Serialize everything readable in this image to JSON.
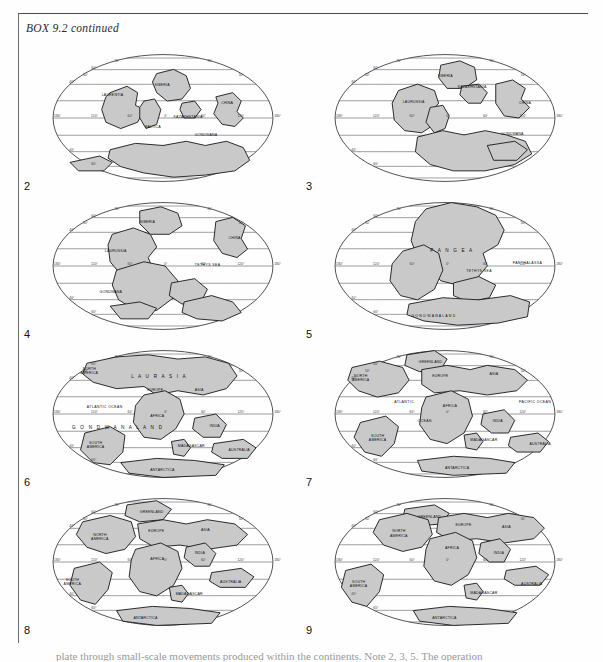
{
  "box": {
    "title": "BOX 9.2  continued"
  },
  "body_text": "plate through small-scale movements produced within the continents. Note 2, 3, 5. The operation",
  "graticule": {
    "lat_ticks": [
      "60°",
      "40°",
      "0°",
      "40°",
      "60°"
    ],
    "lon_ticks": [
      "120°",
      "60°",
      "0°",
      "60°",
      "120°",
      "180°"
    ],
    "pole_tick": "80°",
    "projection": "Mollweide"
  },
  "panels": [
    {
      "number": "2",
      "name": "panel-2",
      "labels": [
        {
          "text": "SIBERIA",
          "x": 102,
          "y": 40,
          "cls": "lbl"
        },
        {
          "text": "LAURENTIA",
          "x": 52,
          "y": 49,
          "cls": "lbl"
        },
        {
          "text": "KAZAKHSTANIA",
          "x": 120,
          "y": 70,
          "cls": "lbl"
        },
        {
          "text": "BALTICA",
          "x": 93,
          "y": 79,
          "cls": "lbl"
        },
        {
          "text": "CHINA",
          "x": 165,
          "y": 57,
          "cls": "lbl"
        },
        {
          "text": "GONDWANA",
          "x": 140,
          "y": 87,
          "cls": "lbl"
        }
      ]
    },
    {
      "number": "3",
      "name": "panel-3",
      "labels": [
        {
          "text": "SIBERIA",
          "x": 103,
          "y": 31,
          "cls": "lbl"
        },
        {
          "text": "KAZAKHSTANIA",
          "x": 122,
          "y": 42,
          "cls": "lbl"
        },
        {
          "text": "LAURUSSIA",
          "x": 70,
          "y": 56,
          "cls": "lbl"
        },
        {
          "text": "CHINA",
          "x": 180,
          "y": 57,
          "cls": "lbl"
        },
        {
          "text": "GONDWANA",
          "x": 163,
          "y": 86,
          "cls": "lbl"
        }
      ]
    },
    {
      "number": "4",
      "name": "panel-4",
      "labels": [
        {
          "text": "SIBERIA",
          "x": 88,
          "y": 29,
          "cls": "lbl"
        },
        {
          "text": "LAURUSSIA",
          "x": 55,
          "y": 57,
          "cls": "lbl"
        },
        {
          "text": "CHINA",
          "x": 172,
          "y": 44,
          "cls": "lbl"
        },
        {
          "text": "TETHYS SEA",
          "x": 140,
          "y": 70,
          "cls": "lbl-sea"
        },
        {
          "text": "GONDWANA",
          "x": 50,
          "y": 96,
          "cls": "lbl"
        }
      ]
    },
    {
      "number": "5",
      "name": "panel-5",
      "labels": [
        {
          "text": "P A N G E A",
          "x": 96,
          "y": 57,
          "cls": "lbl-big"
        },
        {
          "text": "PANTHALASSA",
          "x": 174,
          "y": 68,
          "cls": "lbl-sea"
        },
        {
          "text": "TETHYS SEA",
          "x": 130,
          "y": 76,
          "cls": "lbl-sea"
        },
        {
          "text": "G O N D W A N A L A N D",
          "x": 78,
          "y": 118,
          "cls": "lbl"
        }
      ]
    },
    {
      "number": "6",
      "name": "panel-6",
      "labels": [
        {
          "text": "L A U R A S I A",
          "x": 80,
          "y": 36,
          "cls": "lbl-big"
        },
        {
          "text": "NORTH",
          "x": 34,
          "y": 28,
          "cls": "lbl"
        },
        {
          "text": "AMERICA",
          "x": 32,
          "y": 32,
          "cls": "lbl"
        },
        {
          "text": "EUROPE",
          "x": 95,
          "y": 48,
          "cls": "lbl"
        },
        {
          "text": "ASIA",
          "x": 140,
          "y": 48,
          "cls": "lbl"
        },
        {
          "text": "ATLANTIC OCEAN",
          "x": 38,
          "y": 64,
          "cls": "lbl-sea"
        },
        {
          "text": "G O N D W A N A L A N D",
          "x": 24,
          "y": 84,
          "cls": "lbl-big"
        },
        {
          "text": "AFRICA",
          "x": 98,
          "y": 73,
          "cls": "lbl"
        },
        {
          "text": "INDIA",
          "x": 154,
          "y": 82,
          "cls": "lbl"
        },
        {
          "text": "SOUTH",
          "x": 40,
          "y": 98,
          "cls": "lbl"
        },
        {
          "text": "AMERICA",
          "x": 38,
          "y": 102,
          "cls": "lbl"
        },
        {
          "text": "MADAGASCAR",
          "x": 124,
          "y": 101,
          "cls": "lbl"
        },
        {
          "text": "AUSTRALIA",
          "x": 172,
          "y": 105,
          "cls": "lbl"
        },
        {
          "text": "ANTARCTICA",
          "x": 98,
          "y": 124,
          "cls": "lbl"
        }
      ]
    },
    {
      "number": "7",
      "name": "panel-7",
      "labels": [
        {
          "text": "GREENLAND",
          "x": 85,
          "y": 22,
          "cls": "lbl"
        },
        {
          "text": "NORTH",
          "x": 24,
          "y": 35,
          "cls": "lbl"
        },
        {
          "text": "AMERICA",
          "x": 22,
          "y": 39,
          "cls": "lbl"
        },
        {
          "text": "EUROPE",
          "x": 98,
          "y": 35,
          "cls": "lbl"
        },
        {
          "text": "ASIA",
          "x": 152,
          "y": 33,
          "cls": "lbl"
        },
        {
          "text": "ATLANTIC",
          "x": 62,
          "y": 60,
          "cls": "lbl-sea"
        },
        {
          "text": "OCEAN",
          "x": 84,
          "y": 78,
          "cls": "lbl-sea"
        },
        {
          "text": "AFRICA",
          "x": 108,
          "y": 63,
          "cls": "lbl"
        },
        {
          "text": "PACIFIC OCEAN",
          "x": 180,
          "y": 60,
          "cls": "lbl-sea"
        },
        {
          "text": "INDIA",
          "x": 155,
          "y": 78,
          "cls": "lbl"
        },
        {
          "text": "SOUTH",
          "x": 40,
          "y": 92,
          "cls": "lbl"
        },
        {
          "text": "AMERICA",
          "x": 38,
          "y": 96,
          "cls": "lbl"
        },
        {
          "text": "MADAGASCAR",
          "x": 134,
          "y": 96,
          "cls": "lbl"
        },
        {
          "text": "AUSTRALIA",
          "x": 190,
          "y": 99,
          "cls": "lbl"
        },
        {
          "text": "ANTARCTICA",
          "x": 110,
          "y": 122,
          "cls": "lbl"
        }
      ]
    },
    {
      "number": "8",
      "name": "panel-8",
      "labels": [
        {
          "text": "GREENLAND",
          "x": 88,
          "y": 24,
          "cls": "lbl"
        },
        {
          "text": "NORTH",
          "x": 44,
          "y": 45,
          "cls": "lbl"
        },
        {
          "text": "AMERICA",
          "x": 42,
          "y": 49,
          "cls": "lbl"
        },
        {
          "text": "EUROPE",
          "x": 96,
          "y": 42,
          "cls": "lbl"
        },
        {
          "text": "ASIA",
          "x": 146,
          "y": 41,
          "cls": "lbl"
        },
        {
          "text": "AFRICA",
          "x": 98,
          "y": 68,
          "cls": "lbl"
        },
        {
          "text": "INDIA",
          "x": 140,
          "y": 62,
          "cls": "lbl"
        },
        {
          "text": "SOUTH",
          "x": 18,
          "y": 88,
          "cls": "lbl"
        },
        {
          "text": "AMERICA",
          "x": 16,
          "y": 92,
          "cls": "lbl"
        },
        {
          "text": "MADAGASCAR",
          "x": 122,
          "y": 101,
          "cls": "lbl"
        },
        {
          "text": "AUSTRALIA",
          "x": 164,
          "y": 90,
          "cls": "lbl"
        },
        {
          "text": "ANTARCTICA",
          "x": 82,
          "y": 124,
          "cls": "lbl"
        }
      ]
    },
    {
      "number": "9",
      "name": "panel-9",
      "labels": [
        {
          "text": "GREENLAND",
          "x": 84,
          "y": 28,
          "cls": "lbl"
        },
        {
          "text": "NORTH",
          "x": 60,
          "y": 42,
          "cls": "lbl"
        },
        {
          "text": "AMERICA",
          "x": 58,
          "y": 46,
          "cls": "lbl"
        },
        {
          "text": "EUROPE",
          "x": 120,
          "y": 36,
          "cls": "lbl"
        },
        {
          "text": "ASIA",
          "x": 164,
          "y": 38,
          "cls": "lbl"
        },
        {
          "text": "AFRICA",
          "x": 110,
          "y": 58,
          "cls": "lbl"
        },
        {
          "text": "INDIA",
          "x": 156,
          "y": 62,
          "cls": "lbl"
        },
        {
          "text": "SOUTH",
          "x": 22,
          "y": 90,
          "cls": "lbl"
        },
        {
          "text": "AMERICA",
          "x": 20,
          "y": 94,
          "cls": "lbl"
        },
        {
          "text": "MADAGASCAR",
          "x": 134,
          "y": 100,
          "cls": "lbl"
        },
        {
          "text": "AUSTRALIA",
          "x": 182,
          "y": 92,
          "cls": "lbl"
        },
        {
          "text": "ANTARCTICA",
          "x": 98,
          "y": 124,
          "cls": "lbl"
        }
      ]
    }
  ],
  "colors": {
    "land_fill": "#c9c9c9",
    "land_stroke": "#17171a",
    "graticule": "#55555e",
    "page_bg": "#fefefe",
    "text": "#111111"
  },
  "landmasses": {
    "panel-2": [
      "M104,28 L120,24 L132,30 L136,42 L128,52 L114,54 L104,46 L100,36 Z",
      "M60,46 L76,40 L86,46 L84,58 L92,62 L86,74 L70,80 L56,74 L52,62 L56,50 Z",
      "M92,54 L102,52 L108,62 L104,76 L94,80 L88,70 L88,60 Z",
      "M128,56 L140,54 L146,62 L140,70 L130,70 L126,62 Z",
      "M160,50 L176,46 L184,54 L180,64 L186,70 L178,78 L166,76 L158,66 L162,56 Z",
      "M60,100 L84,94 L110,96 L132,92 L150,96 L170,92 L186,98 L192,110 L178,120 L150,124 L120,126 L92,122 L70,116 L58,108 Z",
      "M22,112 L50,106 L62,112 L54,120 L30,120 Z"
    ],
    "panel-3": [
      "M106,20 L124,16 L138,22 L140,34 L128,42 L112,42 L104,32 Z",
      "M126,40 L142,38 L150,46 L144,56 L132,56 L124,48 Z",
      "M66,44 L84,38 L100,44 L104,56 L96,66 L100,76 L88,84 L72,82 L62,72 L60,56 Z",
      "M96,60 L108,58 L114,68 L110,80 L100,84 L92,74 Z",
      "M158,38 L174,34 L186,42 L182,52 L190,60 L180,70 L166,68 L158,56 Z",
      "M84,88 L108,82 L128,86 L148,82 L168,86 L186,92 L192,104 L176,114 L148,120 L118,120 L96,114 L82,102 Z",
      "M150,96 L176,92 L188,100 L178,110 L156,110 Z"
    ],
    "panel-4": [
      "M88,18 L108,14 L124,20 L128,32 L116,40 L98,40 L88,30 Z",
      "M62,40 L82,34 L98,40 L104,52 L96,62 L100,72 L88,80 L70,78 L60,66 L58,50 Z",
      "M160,28 L176,24 L188,32 L184,44 L190,54 L180,62 L166,58 L158,46 Z",
      "M66,74 L92,66 L112,70 L124,84 L120,100 L104,112 L84,112 L68,102 L62,88 Z",
      "M118,86 L140,82 L152,92 L146,104 L128,106 L116,98 Z",
      "M130,104 L156,98 L176,104 L184,114 L166,122 L142,120 L128,114 Z",
      "M60,108 L88,104 L104,110 L96,120 L70,120 Z"
    ],
    "panel-5": [
      "M92,16 L116,10 L140,14 L158,22 L166,36 L160,50 L146,58 L150,70 L140,82 L122,88 L106,84 L96,72 L84,62 L78,46 L82,28 Z",
      "M70,56 L90,50 L104,58 L108,74 L100,92 L84,102 L68,98 L58,84 L60,68 Z",
      "M118,86 L142,80 L158,88 L152,100 L132,104 L118,98 Z",
      "M76,106 L108,100 L142,102 L172,98 L190,104 L188,118 L160,124 L122,126 L90,122 L74,116 Z"
    ],
    "panel-6": [
      "M38,22 L66,16 L96,14 L124,18 L150,16 L172,22 L180,34 L170,46 L148,52 L124,48 L104,52 L92,44 L66,46 L44,40 L34,32 Z",
      "M92,52 L112,48 L126,56 L130,70 L122,84 L108,94 L92,92 L82,78 L84,62 Z",
      "M36,88 L60,82 L74,90 L72,106 L60,118 L44,116 L32,104 Z",
      "M140,74 L160,70 L170,80 L164,92 L148,92 L138,84 Z",
      "M118,96 L130,94 L136,102 L130,110 L120,108 Z",
      "M158,98 L186,94 L198,102 L190,112 L166,112 L156,106 Z",
      "M70,116 L104,112 L140,114 L168,118 L160,128 L110,130 L78,126 Z"
    ],
    "panel-7": [
      "M74,14 L100,10 L112,18 L106,28 L86,30 L72,24 Z",
      "M22,26 L48,20 L70,26 L76,38 L66,50 L46,54 L28,48 L18,38 Z",
      "M88,28 L112,24 L134,28 L150,24 L176,28 L188,38 L178,48 L150,52 L124,48 L100,50 L88,42 Z",
      "M92,54 L116,48 L132,56 L136,72 L128,88 L112,98 L96,94 L86,80 L88,64 Z",
      "M30,78 L54,72 L66,82 L62,98 L50,110 L34,106 L24,92 Z",
      "M146,70 L166,66 L176,76 L170,88 L154,88 L144,80 Z",
      "M128,90 L140,88 L146,96 L140,104 L130,102 Z",
      "M172,92 L198,88 L208,96 L200,106 L178,106 L170,100 Z",
      "M84,114 L118,110 L152,112 L176,116 L168,126 L118,128 L88,124 Z"
    ],
    "panel-8": [
      "M76,16 L104,12 L118,20 L110,30 L88,32 L74,26 Z",
      "M34,32 L60,26 L80,32 L84,46 L74,58 L56,62 L38,56 L28,44 Z",
      "M86,34 L110,30 L132,34 L152,30 L178,34 L190,44 L180,54 L152,58 L126,54 L102,56 L88,48 Z",
      "M84,58 L108,52 L124,60 L128,76 L120,92 L104,102 L88,98 L78,84 L80,68 Z",
      "M26,76 L50,70 L62,80 L58,96 L46,110 L32,106 L22,92 Z",
      "M132,56 L150,52 L160,62 L154,74 L140,74 L130,66 Z",
      "M116,94 L128,92 L134,100 L128,108 L118,106 Z",
      "M156,80 L184,76 L196,84 L188,94 L164,94 L154,88 Z",
      "M66,116 L100,112 L136,114 L164,118 L156,128 L104,130 L72,126 Z"
    ],
    "panel-9": [
      "M72,20 L100,16 L114,24 L106,34 L84,36 L70,30 Z",
      "M48,30 L74,24 L94,30 L98,44 L88,56 L70,60 L52,54 L42,42 Z",
      "M104,28 L128,24 L150,28 L170,24 L194,28 L204,38 L194,48 L166,52 L140,48 L116,50 L102,42 Z",
      "M96,48 L120,42 L136,50 L140,66 L132,82 L116,92 L100,88 L90,74 L92,58 Z",
      "M16,78 L40,72 L52,82 L48,98 L36,112 L22,108 L12,94 Z",
      "M144,52 L162,48 L172,58 L166,70 L152,70 L142,62 Z",
      "M128,92 L140,90 L146,98 L140,106 L130,104 Z",
      "M168,78 L196,74 L208,82 L200,92 L176,92 L166,86 Z",
      "M80,116 L114,112 L150,114 L178,118 L170,128 L118,130 L86,126 Z"
    ]
  }
}
